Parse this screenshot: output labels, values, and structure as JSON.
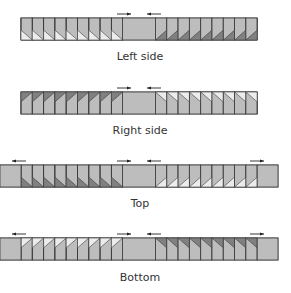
{
  "diagram": {
    "rows": [
      {
        "label": "Left side",
        "y": 18,
        "label_y": 50,
        "x_start": 21,
        "x_end": 257,
        "outer_plain": false,
        "left_blocks": {
          "count": 9,
          "style": "light-corner-bottom-left-diag-down"
        },
        "right_blocks": {
          "count": 9,
          "style": "dark-corner-bottom-right-diag-up"
        },
        "arrows": [
          {
            "x": 117,
            "dir": "right"
          },
          {
            "x": 147,
            "dir": "left"
          }
        ]
      },
      {
        "label": "Right side",
        "y": 92,
        "label_y": 124,
        "x_start": 21,
        "x_end": 257,
        "outer_plain": false,
        "left_blocks": {
          "count": 9,
          "style": "dark-corner-top-left-diag-up"
        },
        "right_blocks": {
          "count": 9,
          "style": "light-corner-top-right-diag-down"
        },
        "arrows": [
          {
            "x": 117,
            "dir": "right"
          },
          {
            "x": 147,
            "dir": "left"
          }
        ]
      },
      {
        "label": "Top",
        "y": 165,
        "label_y": 197,
        "x_start": 0,
        "x_end": 278,
        "outer_plain": true,
        "left_blocks": {
          "count": 9,
          "style": "dark-corner-bottom-left-diag-down"
        },
        "right_blocks": {
          "count": 9,
          "style": "light-corner-bottom-right-diag-up"
        },
        "arrows": [
          {
            "x": 12,
            "dir": "left"
          },
          {
            "x": 117,
            "dir": "right"
          },
          {
            "x": 147,
            "dir": "left"
          },
          {
            "x": 250,
            "dir": "right"
          }
        ]
      },
      {
        "label": "Bottom",
        "y": 238,
        "label_y": 271,
        "x_start": 0,
        "x_end": 278,
        "outer_plain": true,
        "left_blocks": {
          "count": 9,
          "style": "light-corner-top-left-diag-up"
        },
        "right_blocks": {
          "count": 9,
          "style": "dark-corner-top-right-diag-down"
        },
        "arrows": [
          {
            "x": 12,
            "dir": "left"
          },
          {
            "x": 117,
            "dir": "right"
          },
          {
            "x": 147,
            "dir": "left"
          },
          {
            "x": 250,
            "dir": "right"
          }
        ]
      }
    ],
    "colors": {
      "fill": "#bdbdbd",
      "dark": "#808080",
      "light": "#ececec",
      "stroke": "#3a3a3a",
      "arrow": "#222222"
    }
  }
}
